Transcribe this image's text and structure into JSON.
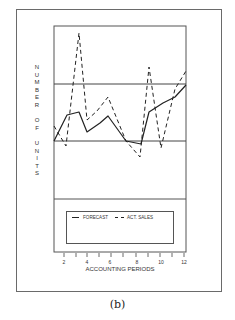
{
  "chart_data": {
    "type": "line",
    "title": "",
    "caption": "(b)",
    "xlabel": "ACCOUNTING PERIODS",
    "ylabel": "NUMBER OF UNITS",
    "x": [
      1,
      2,
      3,
      4,
      5,
      6,
      7,
      8,
      9,
      10,
      11,
      12
    ],
    "x_tick_labels": [
      "2",
      "4",
      "6",
      "8",
      "10",
      "12"
    ],
    "xlim": [
      1,
      12
    ],
    "y_ticks_shown": false,
    "reference_lines": [
      {
        "name": "upper-control-limit",
        "relative_level": 0.63
      },
      {
        "name": "lower-control-limit",
        "relative_level": 0.34
      }
    ],
    "legend": {
      "position": "below-plot",
      "entries": [
        "FORECAST",
        "ACT. SALES"
      ]
    },
    "series": [
      {
        "name": "FORECAST",
        "style": "solid",
        "values": [
          0.34,
          0.48,
          0.5,
          0.39,
          0.44,
          0.48,
          0.39,
          0.34,
          0.32,
          0.5,
          0.55,
          0.62
        ]
      },
      {
        "name": "ACT. SALES",
        "style": "dashed",
        "values": [
          0.42,
          0.31,
          0.92,
          0.46,
          0.51,
          0.58,
          0.34,
          0.23,
          0.72,
          0.28,
          0.62,
          0.71
        ]
      }
    ],
    "grid": false
  },
  "figure": {
    "ylabel_letters": [
      "N",
      "U",
      "M",
      "B",
      "E",
      "R",
      "",
      "O",
      "F",
      "",
      "U",
      "N",
      "I",
      "T",
      "S"
    ],
    "xlabel": "ACCOUNTING PERIODS",
    "tick_labels": [
      {
        "text": "2",
        "x": 64
      },
      {
        "text": "4",
        "x": 87
      },
      {
        "text": "6",
        "x": 110
      },
      {
        "text": "8",
        "x": 137
      },
      {
        "text": "10",
        "x": 161
      },
      {
        "text": "12",
        "x": 184
      }
    ],
    "legend": {
      "forecast_label": "FORECAST",
      "sales_label": "ACT. SALES"
    },
    "caption": "(b)"
  }
}
